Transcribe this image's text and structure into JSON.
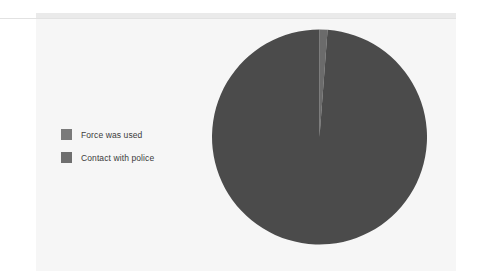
{
  "figure": {
    "background_color": "#f6f6f6",
    "page_color": "#ffffff"
  },
  "legend": {
    "position": "left",
    "items": [
      {
        "label": "Force was used",
        "color": "#7a7a7a",
        "swatch_name": "legend-swatch-force-was-used"
      },
      {
        "label": "Contact with police",
        "color": "#6f6f6f",
        "swatch_name": "legend-swatch-contact-with-police"
      }
    ]
  },
  "chart_data": {
    "type": "pie",
    "title": "",
    "subtitle": "",
    "xlabel": "",
    "ylabel": "",
    "grid": false,
    "legend_position": "left",
    "start_angle_deg": 0,
    "direction": "clockwise",
    "categories": [
      "Force was used",
      "Contact with police"
    ],
    "values": [
      1.2,
      98.8
    ],
    "units": "percent",
    "slices": [
      {
        "label": "Force was used",
        "value": 1.2,
        "color": "#6b6b6b",
        "start_angle_deg": 0,
        "end_angle_deg": 4.3
      },
      {
        "label": "Contact with police",
        "value": 98.8,
        "color": "#4b4b4b",
        "start_angle_deg": 4.3,
        "end_angle_deg": 360
      }
    ]
  }
}
